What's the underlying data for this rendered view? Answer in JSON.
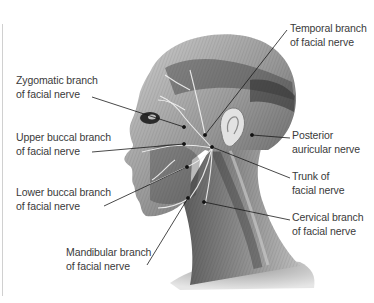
{
  "figure": {
    "labels": [
      {
        "id": "temporal",
        "line1": "Temporal branch",
        "line2": "of facial nerve"
      },
      {
        "id": "zygomatic",
        "line1": "Zygomatic branch",
        "line2": "of facial nerve"
      },
      {
        "id": "upper_buccal",
        "line1": "Upper buccal branch",
        "line2": "of facial nerve"
      },
      {
        "id": "posterior_auricular",
        "line1": "Posterior",
        "line2": "auricular nerve"
      },
      {
        "id": "trunk",
        "line1": "Trunk of",
        "line2": "facial nerve"
      },
      {
        "id": "lower_buccal",
        "line1": "Lower buccal branch",
        "line2": "of facial nerve"
      },
      {
        "id": "cervical",
        "line1": "Cervical branch",
        "line2": "of facial nerve"
      },
      {
        "id": "mandibular",
        "line1": "Mandibular branch",
        "line2": "of facial nerve"
      }
    ]
  },
  "colors": {
    "label_text": "#3a3a3a",
    "leader_line": "#1a1a1a",
    "skin_dark": "#4a4a4a",
    "skin_mid": "#8a8a8a",
    "skin_light": "#d8d8d8",
    "nerve": "#f2f2f2"
  }
}
